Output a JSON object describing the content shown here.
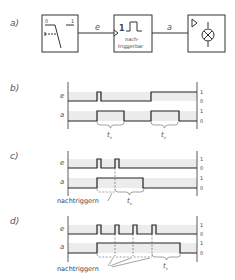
{
  "panels": {
    "a": {
      "label": "a)"
    },
    "b": {
      "label": "b)"
    },
    "c": {
      "label": "c)"
    },
    "d": {
      "label": "d)"
    }
  },
  "block_diagram": {
    "switch_block": {
      "label_0": "0",
      "label_1": "1"
    },
    "signal_e": "e",
    "monoflop_block": {
      "symbol": "1",
      "line1": "nach-",
      "line2": "triggerbar"
    },
    "signal_a": "a",
    "lamp_block": {
      "icon": "lamp-icon"
    }
  },
  "timing": {
    "signal_e": "e",
    "signal_a": "a",
    "level_high": "1",
    "level_low": "0",
    "tv_label": "t",
    "tv_sub": "v",
    "retrigger_label": "nachtriggern"
  },
  "colors": {
    "line": "#333333",
    "band": "#ececec"
  }
}
